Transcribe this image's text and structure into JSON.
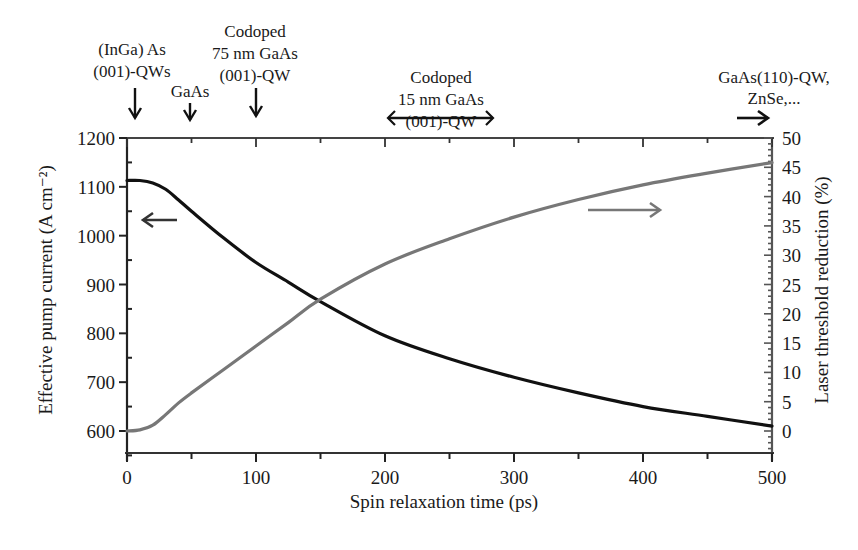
{
  "chart_data": {
    "type": "line",
    "title": "",
    "xlabel": "Spin relaxation time (ps)",
    "ylabel": "Effective pump current (A cm⁻²)",
    "y2label": "Laser threshold reduction (%)",
    "xlim": [
      0,
      500
    ],
    "ylim": [
      550,
      1200
    ],
    "y2lim": [
      -3,
      50
    ],
    "x_ticks": [
      "0",
      "100",
      "200",
      "300",
      "400",
      "500"
    ],
    "y_ticks": [
      "600",
      "700",
      "800",
      "900",
      "1000",
      "1100",
      "1200"
    ],
    "y2_ticks": [
      "0",
      "5",
      "10",
      "15",
      "20",
      "25",
      "30",
      "35",
      "40",
      "45",
      "50"
    ],
    "grid": false,
    "series": [
      {
        "name": "Effective pump current",
        "axis": "left",
        "color": "#111111",
        "x": [
          0,
          10,
          20,
          30,
          40,
          50,
          75,
          100,
          125,
          150,
          200,
          250,
          300,
          350,
          400,
          450,
          500
        ],
        "y": [
          1113,
          1113,
          1108,
          1095,
          1073,
          1050,
          995,
          945,
          905,
          865,
          795,
          748,
          710,
          678,
          650,
          630,
          610
        ]
      },
      {
        "name": "Laser threshold reduction",
        "axis": "right",
        "color": "#777777",
        "x": [
          0,
          10,
          20,
          30,
          40,
          50,
          75,
          100,
          125,
          150,
          200,
          250,
          300,
          350,
          400,
          450,
          500
        ],
        "y": [
          0,
          0.2,
          1.0,
          2.8,
          4.8,
          6.5,
          10.5,
          14.5,
          18.5,
          22.5,
          28.5,
          32.8,
          36.5,
          39.5,
          42,
          44,
          45.8
        ]
      }
    ],
    "annotations": [
      {
        "text": [
          "(InGa) As",
          "(001)-QWs"
        ],
        "x": 5,
        "marker": "down-arrow"
      },
      {
        "text": [
          "GaAs"
        ],
        "x": 50,
        "marker": "down-arrow"
      },
      {
        "text": [
          "Codoped",
          "75 nm GaAs",
          "(001)-QW"
        ],
        "x": 100,
        "marker": "down-arrow"
      },
      {
        "text": [
          "Codoped",
          "15 nm GaAs",
          "(001)-QW"
        ],
        "x_range": [
          205,
          285
        ],
        "marker": "range-bracket"
      },
      {
        "text": [
          "GaAs(110)-QW,",
          "ZnSe,..."
        ],
        "x": 490,
        "marker": "right-arrow"
      },
      {
        "text": [],
        "marker": "left-arrow",
        "note": "points current curve to left axis"
      },
      {
        "text": [],
        "marker": "right-arrow",
        "note": "points threshold curve to right axis"
      }
    ]
  }
}
